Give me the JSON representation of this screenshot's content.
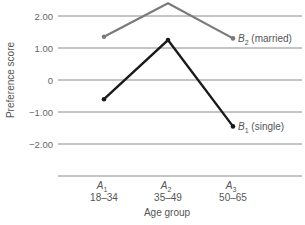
{
  "chart_data": {
    "type": "line",
    "title": "",
    "xlabel": "Age group",
    "ylabel": "Preference score",
    "categories": [
      "A1 18–34",
      "A2 35–49",
      "A3 50–65"
    ],
    "category_labels": [
      {
        "factor": "A",
        "sub": "1",
        "range": "18–34"
      },
      {
        "factor": "A",
        "sub": "2",
        "range": "35–49"
      },
      {
        "factor": "A",
        "sub": "3",
        "range": "50–65"
      }
    ],
    "yticks": [
      "2.00",
      "1.00",
      "0",
      "−1.00",
      "−2.00"
    ],
    "ytick_values": [
      2,
      1,
      0,
      -1,
      -2
    ],
    "ylim": [
      -3,
      2.5
    ],
    "grid": true,
    "series": [
      {
        "name": "B2 (married)",
        "label_main": "B",
        "label_sub": "2",
        "label_rest": " (married)",
        "values": [
          1.35,
          2.4,
          1.3
        ],
        "color": "#7a7a7a"
      },
      {
        "name": "B1 (single)",
        "label_main": "B",
        "label_sub": "1",
        "label_rest": " (single)",
        "values": [
          -0.6,
          1.25,
          -1.45
        ],
        "color": "#1a1a1a"
      }
    ],
    "legend_position": "inline-right"
  }
}
